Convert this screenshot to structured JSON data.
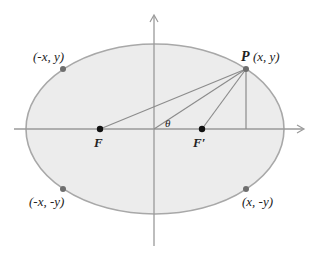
{
  "diagram": {
    "type": "ellipse-foci",
    "colors": {
      "ellipse_fill": "#ececec",
      "ellipse_stroke": "#a8a8a8",
      "axis": "#9a9a9a",
      "segment": "#8c8c8c",
      "point_gray": "#6e6e6e",
      "focus_black": "#111111",
      "text": "#222222"
    },
    "labels": {
      "P_name": "P",
      "P_coords": "(x, y)",
      "top_left": "(-x, y)",
      "bottom_left": "(-x, -y)",
      "bottom_right": "(x, -y)",
      "focus_left": "F",
      "focus_right": "F′",
      "angle": "θ"
    },
    "points": [
      {
        "name": "P",
        "label": "(x, y)",
        "x": 246,
        "y": 69
      },
      {
        "name": "top-left",
        "label": "(-x, y)",
        "x": 63,
        "y": 69
      },
      {
        "name": "bottom-left",
        "label": "(-x, -y)",
        "x": 63,
        "y": 189
      },
      {
        "name": "bottom-right",
        "label": "(x, -y)",
        "x": 246,
        "y": 189
      }
    ],
    "foci": [
      {
        "name": "F",
        "x": 100,
        "y": 129
      },
      {
        "name": "F′",
        "x": 202,
        "y": 129
      }
    ],
    "ellipse": {
      "cx": 155,
      "cy": 129,
      "rx": 129,
      "ry": 85
    }
  }
}
